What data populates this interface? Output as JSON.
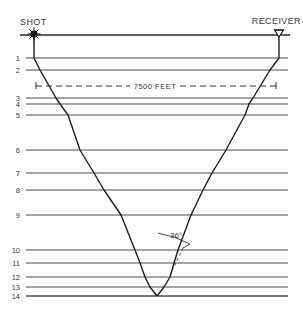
{
  "diagram": {
    "type": "seismic-ray-path",
    "shot_label": "SHOT",
    "receiver_label": "RECEIVER",
    "offset_label": "7500 FEET",
    "angle_label": "36°",
    "ink_color": "#1e1e1e",
    "line_color": "#4a4a4a",
    "surface_y": 35,
    "line_x_start": 26,
    "line_x_end": 288,
    "layers": [
      {
        "label": "1",
        "y": 58
      },
      {
        "label": "2",
        "y": 70
      },
      {
        "label": "3",
        "y": 98
      },
      {
        "label": "4",
        "y": 104
      },
      {
        "label": "5",
        "y": 115
      },
      {
        "label": "6",
        "y": 150
      },
      {
        "label": "7",
        "y": 173
      },
      {
        "label": "8",
        "y": 190
      },
      {
        "label": "9",
        "y": 215
      },
      {
        "label": "10",
        "y": 250
      },
      {
        "label": "11",
        "y": 263
      },
      {
        "label": "12",
        "y": 277
      },
      {
        "label": "13",
        "y": 287
      },
      {
        "label": "14",
        "y": 296
      }
    ],
    "shot_pos": [
      34,
      34
    ],
    "receiver_pos": [
      279,
      34
    ],
    "ray_down": [
      [
        34,
        35
      ],
      [
        34,
        58
      ],
      [
        40,
        70
      ],
      [
        56,
        98
      ],
      [
        60,
        104
      ],
      [
        68,
        115
      ],
      [
        80,
        150
      ],
      [
        94,
        173
      ],
      [
        104,
        190
      ],
      [
        121,
        215
      ],
      [
        135,
        250
      ],
      [
        140,
        263
      ],
      [
        145,
        277
      ],
      [
        150,
        287
      ],
      [
        157,
        296
      ]
    ],
    "ray_up": [
      [
        157,
        296
      ],
      [
        164,
        287
      ],
      [
        170,
        277
      ],
      [
        174,
        263
      ],
      [
        178,
        250
      ],
      [
        191,
        215
      ],
      [
        203,
        190
      ],
      [
        212,
        173
      ],
      [
        226,
        150
      ],
      [
        245,
        115
      ],
      [
        249,
        104
      ],
      [
        253,
        98
      ],
      [
        270,
        70
      ],
      [
        279,
        58
      ],
      [
        279,
        35
      ]
    ]
  }
}
